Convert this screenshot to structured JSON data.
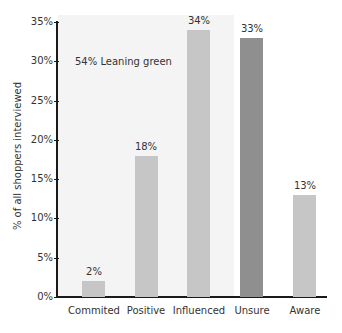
{
  "chart_data": {
    "type": "bar",
    "title": "",
    "xlabel": "",
    "ylabel": "% of all shoppers interviewed",
    "ylim": [
      0,
      35
    ],
    "yticks": [
      "0%",
      "5%",
      "10%",
      "15%",
      "20%",
      "25%",
      "30%",
      "35%"
    ],
    "categories": [
      "Commited",
      "Positive",
      "Influenced",
      "Unsure",
      "Aware"
    ],
    "values": [
      2,
      18,
      34,
      33,
      13
    ],
    "value_labels": [
      "2%",
      "18%",
      "34%",
      "33%",
      "13%"
    ],
    "bar_colors": [
      "#c6c6c6",
      "#c6c6c6",
      "#c6c6c6",
      "#8f8f8f",
      "#c6c6c6"
    ],
    "annotations": [
      {
        "text": "54% Leaning green",
        "region": "shaded background covering Commited, Positive, Influenced"
      }
    ],
    "grid": false,
    "legend": null
  },
  "colors": {
    "shade": "#f4f4f4",
    "axis": "#1a1a1a",
    "bar_light": "#c6c6c6",
    "bar_dark": "#8f8f8f",
    "text": "#333333"
  }
}
